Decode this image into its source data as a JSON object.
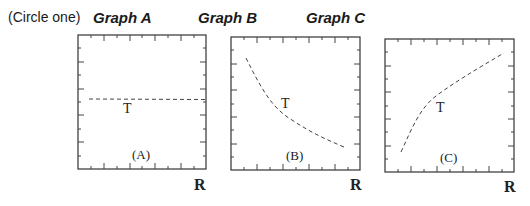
{
  "header": {
    "instruction": "(Circle one)",
    "choices": [
      {
        "label": "Graph A"
      },
      {
        "label": "Graph B"
      },
      {
        "label": "Graph C"
      }
    ]
  },
  "graphs": [
    {
      "id": "A",
      "caption": "(A)",
      "curve_label": "T",
      "axis_label": "R",
      "shape": "constant"
    },
    {
      "id": "B",
      "caption": "(B)",
      "curve_label": "T",
      "axis_label": "R",
      "shape": "decreasing"
    },
    {
      "id": "C",
      "caption": "(C)",
      "curve_label": "T",
      "axis_label": "R",
      "shape": "increasing"
    }
  ],
  "colors": {
    "line": "#333333",
    "dash": "#444444",
    "text": "#1a1a1a"
  }
}
